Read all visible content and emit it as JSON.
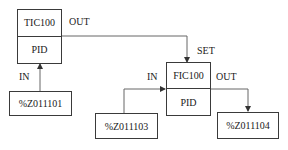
{
  "blocks": {
    "tic": {
      "tag": "TIC100",
      "type": "PID"
    },
    "fic": {
      "tag": "FIC100",
      "type": "PID"
    }
  },
  "io": {
    "tic_input": "%Z011101",
    "fic_input": "%Z011103",
    "fic_output": "%Z011104"
  },
  "pins": {
    "tic_out": "OUT",
    "tic_in": "IN",
    "fic_set": "SET",
    "fic_in": "IN",
    "fic_out": "OUT"
  },
  "colors": {
    "line": "#555555",
    "text": "#1a1a1a"
  }
}
